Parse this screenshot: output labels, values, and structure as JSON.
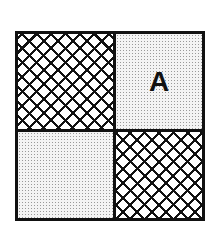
{
  "diagram": {
    "type": "2x2 grid",
    "cells": [
      {
        "position": "top-left",
        "pattern": "crosshatch",
        "label": ""
      },
      {
        "position": "top-right",
        "pattern": "dotted",
        "label": "A"
      },
      {
        "position": "bottom-left",
        "pattern": "dotted",
        "label": ""
      },
      {
        "position": "bottom-right",
        "pattern": "crosshatch",
        "label": ""
      }
    ],
    "colors": {
      "line": "#111111",
      "dot_fill": "#9a9a9a",
      "background": "#ffffff"
    }
  }
}
